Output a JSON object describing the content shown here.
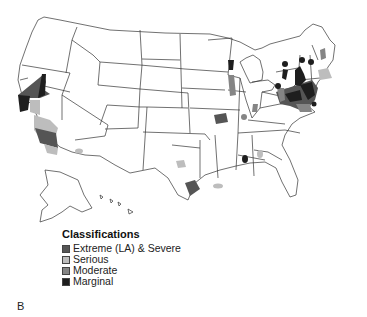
{
  "figure": {
    "panel_label": "B",
    "map_title": "United States nonattainment areas by classification"
  },
  "legend": {
    "title": "Classifications",
    "items": [
      {
        "label": "Extreme (LA) & Severe",
        "color": "#555555"
      },
      {
        "label": "Serious",
        "color": "#bdbdbd"
      },
      {
        "label": "Moderate",
        "color": "#858585"
      },
      {
        "label": "Marginal",
        "color": "#1e1e1e"
      }
    ]
  },
  "colors": {
    "extreme": "#555555",
    "serious": "#bdbdbd",
    "moderate": "#858585",
    "marginal": "#1e1e1e",
    "outline": "#333333"
  }
}
